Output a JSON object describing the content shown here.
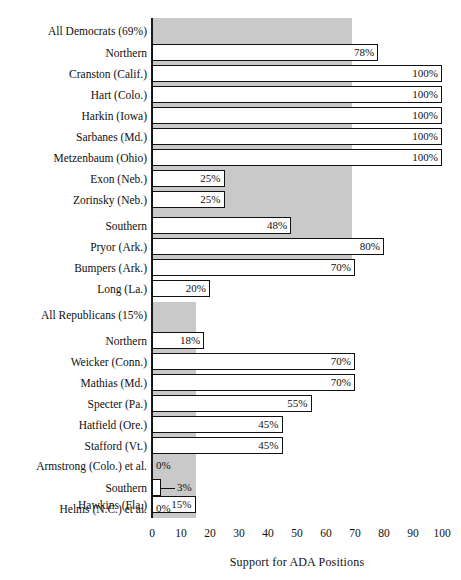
{
  "ghost_text": "",
  "chart_data": {
    "type": "bar",
    "title": "",
    "xlabel": "Support for ADA Positions",
    "ylabel": "",
    "xlim": [
      0,
      100
    ],
    "xticks": [
      0,
      10,
      20,
      30,
      40,
      50,
      60,
      70,
      80,
      90,
      100
    ],
    "xticklabels": [
      "0",
      "10",
      "20",
      "30",
      "40",
      "50",
      "60",
      "70",
      "80",
      "90",
      "100"
    ],
    "grid": false,
    "legend": "none",
    "orientation": "horizontal",
    "value_suffix": "%",
    "reference_bands": [
      {
        "name": "all-democrats-band",
        "value": 69,
        "label": "All Democrats (69%)",
        "color": "#c9c9c9"
      },
      {
        "name": "all-republicans-band",
        "value": 15,
        "label": "All Republicans (15%)",
        "color": "#c9c9c9"
      }
    ],
    "categories": [
      "All Democrats (69%)",
      "Northern",
      "Cranston (Calif.)",
      "Hart (Colo.)",
      "Harkin (Iowa)",
      "Sarbanes (Md.)",
      "Metzenbaum (Ohio)",
      "Exon (Neb.)",
      "Zorinsky (Neb.)",
      "Southern",
      "Pryor (Ark.)",
      "Bumpers (Ark.)",
      "Long (La.)",
      "All Republicans (15%)",
      "Northern",
      "Weicker (Conn.)",
      "Mathias (Md.)",
      "Specter (Pa.)",
      "Hatfield (Ore.)",
      "Stafford (Vt.)",
      "Armstrong (Colo.) et al.",
      "Southern",
      "Hawkins (Fla.)",
      "Helms (N.C.) et al."
    ],
    "values": [
      69,
      78,
      100,
      100,
      100,
      100,
      100,
      25,
      25,
      48,
      80,
      70,
      20,
      15,
      18,
      70,
      70,
      55,
      45,
      45,
      0,
      3,
      15,
      0
    ],
    "value_labels": [
      "",
      "78%",
      "100%",
      "100%",
      "100%",
      "100%",
      "100%",
      "25%",
      "25%",
      "48%",
      "80%",
      "70%",
      "20%",
      "",
      "18%",
      "70%",
      "70%",
      "55%",
      "45%",
      "45%",
      "0%",
      "3%",
      "15%",
      "0%"
    ]
  },
  "rows": [
    {
      "label": "All Democrats (69%)",
      "value": 69,
      "value_label": "",
      "kind": "band",
      "top": 18,
      "leader": false
    },
    {
      "label": "Northern",
      "value": 78,
      "value_label": "78%",
      "kind": "bar",
      "top": 44,
      "leader": false
    },
    {
      "label": "Cranston (Calif.)",
      "value": 100,
      "value_label": "100%",
      "kind": "bar",
      "top": 65,
      "leader": false
    },
    {
      "label": "Hart (Colo.)",
      "value": 100,
      "value_label": "100%",
      "kind": "bar",
      "top": 86,
      "leader": false
    },
    {
      "label": "Harkin (Iowa)",
      "value": 100,
      "value_label": "100%",
      "kind": "bar",
      "top": 107,
      "leader": false
    },
    {
      "label": "Sarbanes (Md.)",
      "value": 100,
      "value_label": "100%",
      "kind": "bar",
      "top": 128,
      "leader": false
    },
    {
      "label": "Metzenbaum (Ohio)",
      "value": 100,
      "value_label": "100%",
      "kind": "bar",
      "top": 149,
      "leader": false
    },
    {
      "label": "Exon (Neb.)",
      "value": 25,
      "value_label": "25%",
      "kind": "bar",
      "top": 170,
      "leader": false
    },
    {
      "label": "Zorinsky (Neb.)",
      "value": 25,
      "value_label": "25%",
      "kind": "bar",
      "top": 191,
      "leader": false
    },
    {
      "label": "Southern",
      "value": 48,
      "value_label": "48%",
      "kind": "bar",
      "top": 217,
      "leader": false
    },
    {
      "label": "Pryor (Ark.)",
      "value": 80,
      "value_label": "80%",
      "kind": "bar",
      "top": 238,
      "leader": false
    },
    {
      "label": "Bumpers (Ark.)",
      "value": 70,
      "value_label": "70%",
      "kind": "bar",
      "top": 259,
      "leader": false
    },
    {
      "label": "Long (La.)",
      "value": 20,
      "value_label": "20%",
      "kind": "bar",
      "top": 280,
      "leader": false
    },
    {
      "label": "All Republicans (15%)",
      "value": 15,
      "value_label": "",
      "kind": "band",
      "top": 317,
      "leader": false
    },
    {
      "label": "Northern",
      "value": 18,
      "value_label": "18%",
      "kind": "bar",
      "top": 343,
      "leader": false
    },
    {
      "label": "Weicker (Conn.)",
      "value": 70,
      "value_label": "70%",
      "kind": "bar",
      "top": 364,
      "leader": false
    },
    {
      "label": "Mathias (Md.)",
      "value": 70,
      "value_label": "70%",
      "kind": "bar",
      "top": 385,
      "leader": false
    },
    {
      "label": "Specter (Pa.)",
      "value": 55,
      "value_label": "55%",
      "kind": "bar",
      "top": 406,
      "leader": false
    },
    {
      "label": "Hatfield (Ore.)",
      "value": 45,
      "value_label": "45%",
      "kind": "bar",
      "top": 427,
      "leader": false
    },
    {
      "label": "Stafford (Vt.)",
      "value": 45,
      "value_label": "45%",
      "kind": "bar",
      "top": 448,
      "leader": false
    },
    {
      "label": "Armstrong (Colo.) et al.",
      "value": 0,
      "value_label": "0%",
      "kind": "zero",
      "top": 469,
      "leader": false
    },
    {
      "label": "Southern",
      "value": 3,
      "value_label": "3%",
      "kind": "bar",
      "top": 495,
      "leader": true
    },
    {
      "label": "Hawkins (Fla.)",
      "value": 15,
      "value_label": "15%",
      "kind": "bar",
      "top": 516,
      "leader": false
    },
    {
      "label": "Helms (N.C.) et al.",
      "value": 0,
      "value_label": "0%",
      "kind": "zero",
      "top": 537,
      "leader": false
    }
  ]
}
